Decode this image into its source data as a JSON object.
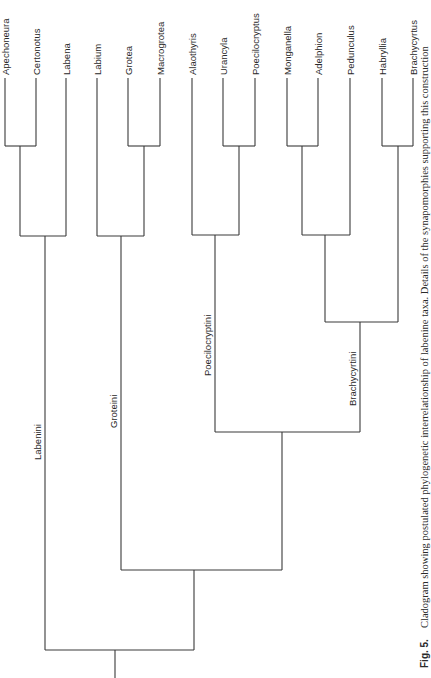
{
  "figure": {
    "caption_label": "Fig. 5.",
    "caption_text": "Cladogram showing postulated phylogenetic interrelationship of labenine taxa. Details of the synapomorphies supporting this construction"
  },
  "taxa": [
    "Apechoneura",
    "Certonotus",
    "Labena",
    "Labium",
    "Grotea",
    "Macrogrotea",
    "Alaothyris",
    "Urancyla",
    "Poecilocryptus",
    "Monganella",
    "Adelphion",
    "Pedunculus",
    "Habryllia",
    "Brachycyrtus"
  ],
  "clades": {
    "labenini": "Labenini",
    "groteini": "Groteini",
    "poecilocryptini": "Poecilocryptini",
    "brachycyrtini": "Brachycyrtini"
  },
  "tree_topology": "((( Apechoneura, Certonotus ), Labena )Labenini, (( Labium, ( Grotea, Macrogrotea ))Groteini, (( Alaothyris, ( Urancyla, Poecilocryptus ))Poecilocryptini, ((( Monganella, Adelphion ), Pedunculus ), ( Habryllia, Brachycyrtus ))Brachycyrtini )))"
}
